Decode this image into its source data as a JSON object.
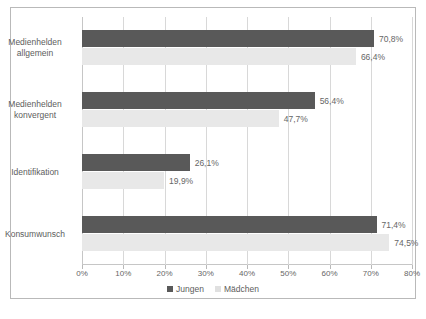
{
  "chart_data": {
    "type": "bar",
    "orientation": "horizontal",
    "title": "",
    "xlabel": "",
    "ylabel": "",
    "xlim": [
      0,
      80
    ],
    "xtick_step": 10,
    "xticks": [
      "0%",
      "10%",
      "20%",
      "30%",
      "40%",
      "50%",
      "60%",
      "70%",
      "80%"
    ],
    "grid": true,
    "legend_position": "bottom",
    "categories": [
      "Medienhelden allgemein",
      "Medienhelden konvergent",
      "Identifikation",
      "Konsumwunsch"
    ],
    "series": [
      {
        "name": "Jungen",
        "color": "#595959",
        "values": [
          70.8,
          56.4,
          26.1,
          71.4
        ],
        "labels": [
          "70,8%",
          "56,4%",
          "26,1%",
          "71,4%"
        ]
      },
      {
        "name": "Mädchen",
        "color": "#e8e8e8",
        "values": [
          66.4,
          47.7,
          19.9,
          74.5
        ],
        "labels": [
          "66,4%",
          "47,7%",
          "19,9%",
          "74,5%"
        ]
      }
    ]
  },
  "categories_display": [
    {
      "line1": "Medienhelden",
      "line2": "allgemein"
    },
    {
      "line1": "Medienhelden",
      "line2": "konvergent"
    },
    {
      "line1": "Identifikation",
      "line2": ""
    },
    {
      "line1": "Konsumwunsch",
      "line2": ""
    }
  ],
  "legend": {
    "boys": "Jungen",
    "girls": "Mädchen"
  },
  "caption": ""
}
